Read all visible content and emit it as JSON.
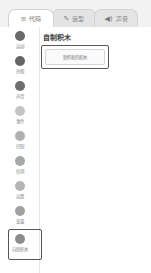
{
  "tabs": [
    {
      "label": "代码",
      "icon": "code-icon",
      "glyph": "≡",
      "active": true
    },
    {
      "label": "造型",
      "icon": "brush-icon",
      "glyph": "✎",
      "active": false
    },
    {
      "label": "声音",
      "icon": "speaker-icon",
      "glyph": "◀)",
      "active": false
    }
  ],
  "categories": [
    {
      "label": "运动",
      "color": "#6a6a6a"
    },
    {
      "label": "外观",
      "color": "#666666"
    },
    {
      "label": "声音",
      "color": "#6e6e6e"
    },
    {
      "label": "事件",
      "color": "#c4c4c4"
    },
    {
      "label": "控制",
      "color": "#b0b0b0"
    },
    {
      "label": "侦测",
      "color": "#a8a8a8"
    },
    {
      "label": "运算",
      "color": "#b5b5b5"
    },
    {
      "label": "变量",
      "color": "#a0a0a0"
    },
    {
      "label": "自制积木",
      "color": "#8c8c8c",
      "selected": true
    }
  ],
  "palette": {
    "heading": "自制积木",
    "make_block_button": "制作新的积木"
  }
}
